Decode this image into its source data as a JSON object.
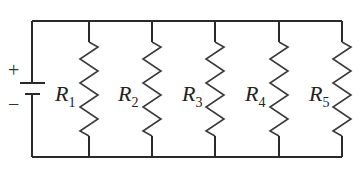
{
  "diagram": {
    "type": "parallel-resistor-circuit",
    "battery": {
      "positive_label": "+",
      "negative_label": "−"
    },
    "resistors": [
      {
        "name": "R",
        "sub": "1"
      },
      {
        "name": "R",
        "sub": "2"
      },
      {
        "name": "R",
        "sub": "3"
      },
      {
        "name": "R",
        "sub": "4"
      },
      {
        "name": "R",
        "sub": "5"
      }
    ],
    "colors": {
      "wire": "#2a2a2a",
      "background": "#ffffff"
    }
  }
}
